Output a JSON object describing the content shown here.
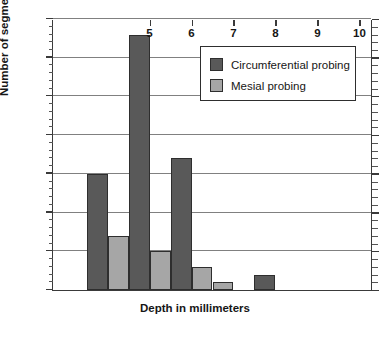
{
  "chart_data": {
    "type": "bar",
    "title": "",
    "xlabel": "Depth in millimeters",
    "ylabel": "Number of segments",
    "xlim": [
      2.7,
      10.3
    ],
    "ylim": [
      0,
      35
    ],
    "ytick_step": 5,
    "yminor_step": 1,
    "grid": "horizontal",
    "legend_position": "top-right-inside",
    "xticks": [
      5,
      6,
      7,
      8,
      9,
      10
    ],
    "xtick_labels": [
      "5",
      "6",
      "7",
      "8",
      "9",
      "10"
    ],
    "yticks": [
      0,
      5,
      10,
      15,
      20,
      25,
      30,
      35
    ],
    "ytick_labels": [
      "0",
      "5",
      "10",
      "15",
      "20",
      "25",
      "30",
      "35"
    ],
    "series": [
      {
        "name": "Circumferential probing",
        "color": "#595959",
        "x": [
          3.5,
          4.5,
          5.5,
          7.5
        ],
        "values": [
          15,
          33,
          17,
          2
        ]
      },
      {
        "name": "Mesial probing",
        "color": "#a6a6a6",
        "x": [
          4.0,
          5.0,
          6.0,
          6.5
        ],
        "values": [
          7,
          5,
          3,
          1
        ]
      }
    ]
  },
  "legend": {
    "entries": [
      {
        "label": "Circumferential probing",
        "color": "#595959"
      },
      {
        "label": "Mesial probing",
        "color": "#a6a6a6"
      }
    ]
  },
  "axes": {
    "x_title": "Depth in millimeters",
    "y_title": "Number of segments"
  }
}
